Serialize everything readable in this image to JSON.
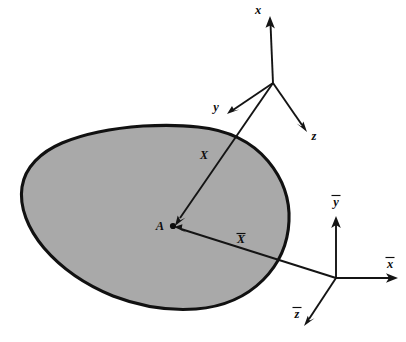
{
  "figure": {
    "background_color": "#ffffff",
    "body": {
      "name": "deformable-body-blob",
      "fill_color": "#a9a9a9",
      "outline_color": "#111111"
    },
    "point": {
      "label": "A",
      "x": 172,
      "y": 226
    },
    "frames": [
      {
        "name": "material-frame",
        "origin": {
          "x": 273,
          "y": 83
        },
        "axes": [
          {
            "id": "x",
            "label": "x",
            "overbar": false,
            "tip": {
              "x": 270,
              "y": 18
            }
          },
          {
            "id": "y",
            "label": "y",
            "overbar": false,
            "tip": {
              "x": 228,
              "y": 114
            }
          },
          {
            "id": "z",
            "label": "z",
            "overbar": false,
            "tip": {
              "x": 307,
              "y": 131
            }
          }
        ]
      },
      {
        "name": "spatial-frame",
        "origin": {
          "x": 336,
          "y": 278
        },
        "axes": [
          {
            "id": "xbar",
            "label": "x",
            "overbar": true,
            "tip": {
              "x": 397,
              "y": 278
            }
          },
          {
            "id": "ybar",
            "label": "y",
            "overbar": true,
            "tip": {
              "x": 336,
              "y": 217
            }
          },
          {
            "id": "zbar",
            "label": "z",
            "overbar": true,
            "tip": {
              "x": 305,
              "y": 325
            }
          }
        ]
      }
    ],
    "vectors": [
      {
        "id": "X",
        "label": "X",
        "overbar": false,
        "from": {
          "x": 273,
          "y": 83
        },
        "to": {
          "x": 176,
          "y": 222
        },
        "label_pos": {
          "x": 204,
          "y": 155
        }
      },
      {
        "id": "Xbar",
        "label": "X",
        "overbar": true,
        "from": {
          "x": 336,
          "y": 278
        },
        "to": {
          "x": 176,
          "y": 228
        },
        "label_pos": {
          "x": 241,
          "y": 241
        }
      }
    ],
    "labels": {
      "x_axis": "x",
      "y_axis": "y",
      "z_axis": "z",
      "xbar_axis": "x",
      "ybar_axis": "y",
      "zbar_axis": "z",
      "vector_X": "X",
      "vector_Xbar": "X",
      "point_A": "A"
    }
  }
}
